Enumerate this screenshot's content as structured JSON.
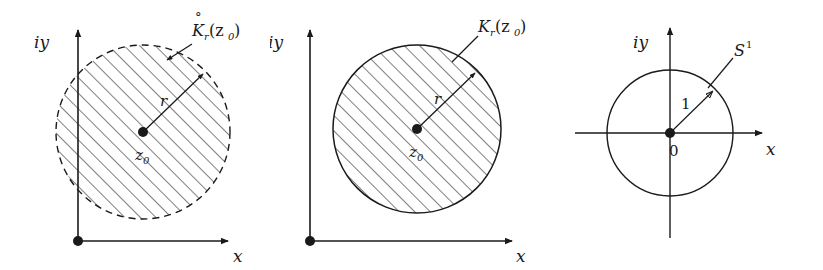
{
  "figure": {
    "width": 823,
    "height": 270,
    "background": "#ffffff",
    "stroke_color": "#1a1a1a",
    "hatch_color": "#3a3a3a"
  },
  "panels": [
    {
      "id": "open-disk",
      "axis_y_label": "iy",
      "axis_x_label": "x",
      "set_label_base": "K",
      "set_label_sub": "r",
      "set_label_arg": "(z",
      "set_label_arg_sub": "0",
      "set_label_arg_close": ")",
      "set_label_accent": "°",
      "set_label_full": "°K_r(z₀)",
      "radius_label": "r",
      "center_label_base": "z",
      "center_label_sub": "0",
      "center_label_full": "z₀",
      "boundary_style": "dashed",
      "origin": {
        "x": 78,
        "y": 241
      },
      "circle": {
        "cx": 143,
        "cy": 132,
        "r": 87
      }
    },
    {
      "id": "closed-disk",
      "axis_y_label": "iy",
      "axis_x_label": "x",
      "set_label_base": "K",
      "set_label_sub": "r",
      "set_label_arg": "(z",
      "set_label_arg_sub": "0",
      "set_label_arg_close": ")",
      "set_label_accent": "",
      "set_label_full": "K_r(z₀)",
      "radius_label": "r",
      "center_label_base": "z",
      "center_label_sub": "0",
      "center_label_full": "z₀",
      "boundary_style": "solid",
      "origin": {
        "x": 310,
        "y": 241
      },
      "circle": {
        "cx": 417,
        "cy": 129,
        "r": 84
      }
    },
    {
      "id": "unit-circle",
      "axis_y_label": "iy",
      "axis_x_label": "x",
      "set_label_base": "S",
      "set_label_sup": "1",
      "set_label_full": "S¹",
      "radius_label": "1",
      "center_label_full": "0",
      "boundary_style": "solid",
      "origin": {
        "x": 670,
        "y": 133
      },
      "circle": {
        "cx": 670,
        "cy": 133,
        "r": 63
      }
    }
  ]
}
